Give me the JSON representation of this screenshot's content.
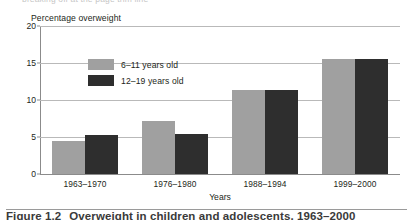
{
  "top_cropped_text": "breaking off at the page trim line",
  "caption": {
    "figure_number": "Figure 1.2",
    "text": "Overweight in children and adolescents, 1963–2000"
  },
  "axis_titles": {
    "y": "Percentage overweight",
    "x": "Years"
  },
  "legend": {
    "items": [
      {
        "label": "6–11 years old",
        "color": "#a0a0a0"
      },
      {
        "label": "12–19 years old",
        "color": "#2e2e2e"
      }
    ]
  },
  "y_ticks": [
    "0",
    "5",
    "10",
    "15",
    "20"
  ],
  "chart_data": {
    "type": "bar",
    "title": "Overweight in children and adolescents, 1963–2000",
    "xlabel": "Years",
    "ylabel": "Percentage overweight",
    "ylim": [
      0,
      20
    ],
    "yticks": [
      0,
      5,
      10,
      15,
      20
    ],
    "grid": true,
    "legend_position": "top-left inside plot",
    "categories": [
      "1963–1970",
      "1976–1980",
      "1988–1994",
      "1999–2000"
    ],
    "series": [
      {
        "name": "6–11 years old",
        "color": "#a0a0a0",
        "values": [
          4.5,
          7.2,
          11.3,
          15.5
        ]
      },
      {
        "name": "12–19 years old",
        "color": "#2e2e2e",
        "values": [
          5.3,
          5.4,
          11.4,
          15.5
        ]
      }
    ]
  }
}
